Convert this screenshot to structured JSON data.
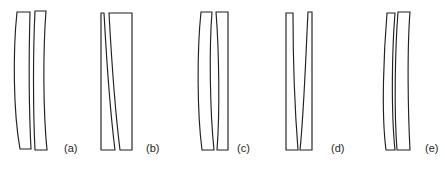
{
  "figure": {
    "background_color": "#ffffff",
    "line_color": "#231f20",
    "fill_color": "#ffffff",
    "width": 445,
    "height": 171,
    "label_font_size": 11,
    "panels": [
      {
        "id": "a",
        "label": "(a)",
        "label_x": 64,
        "label_y": 152,
        "elements": [
          {
            "name": "front-element",
            "description": "meniscus element, convex left surface, concave right surface",
            "path": "M 17,12 C 13,50 13,110 20,149 L 31,149 C 29,110 29,50 30,12 Z"
          },
          {
            "name": "rear-element",
            "description": "meniscus element, convex left surface, concave right surface",
            "path": "M 35,11 C 33,50 33,110 35,150 L 47,150 C 43,110 43,50 46,11 Z"
          }
        ]
      },
      {
        "id": "b",
        "label": "(b)",
        "label_x": 146,
        "label_y": 152,
        "elements": [
          {
            "name": "front-element",
            "description": "plano-concave element, flat left surface, concave right surface",
            "path": "M 101,13 L 101,150 L 115,150 C 110,110 106,50 104,13 Z"
          },
          {
            "name": "rear-element",
            "description": "meniscus element, convex left surface, flat right surface",
            "path": "M 109,13 C 111,50 115,110 120,150 L 132,150 L 132,13 Z"
          }
        ]
      },
      {
        "id": "c",
        "label": "(c)",
        "label_x": 237,
        "label_y": 152,
        "elements": [
          {
            "name": "front-element",
            "description": "biconvex element, convex left surface, convex right surface",
            "path": "M 201,12 C 197,50 197,112 202,150 L 214,150 C 210,112 209,50 212,12 Z"
          },
          {
            "name": "rear-element",
            "description": "plano-concave element, concave left surface, flat right surface",
            "path": "M 216,12 C 219,50 220,112 217,150 L 228,150 L 228,12 Z"
          }
        ]
      },
      {
        "id": "d",
        "label": "(d)",
        "label_x": 331,
        "label_y": 152,
        "elements": [
          {
            "name": "front-element",
            "description": "plano-concave element, flat left surface, concave right surface",
            "path": "M 286,13 L 286,150 L 298,150 C 295,112 293,50 293,13 Z"
          },
          {
            "name": "rear-element",
            "description": "plano-convex element, convex left surface, flat right surface",
            "path": "M 308,12 C 306,50 304,112 300,150 L 312,150 L 312,12 Z"
          }
        ]
      },
      {
        "id": "e",
        "label": "(e)",
        "label_x": 425,
        "label_y": 152,
        "elements": [
          {
            "name": "front-element",
            "description": "meniscus element, concave left surface, concave right surface curving right",
            "path": "M 387,13 C 384,50 381,112 386,150 L 395,150 C 391,112 392,50 395,13 Z"
          },
          {
            "name": "rear-element",
            "description": "meniscus element, convex left surface, flat right surface",
            "path": "M 398,12 C 395,50 394,112 397,150 L 410,150 C 408,112 407,50 410,12 Z"
          }
        ]
      }
    ]
  }
}
